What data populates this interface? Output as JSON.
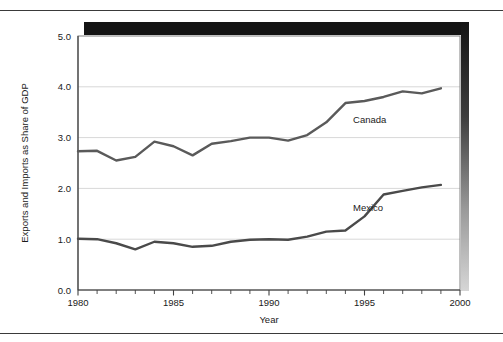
{
  "chart_data": {
    "type": "line",
    "title": "",
    "xlabel": "Year",
    "ylabel": "Exports and Imports as Share of GDP",
    "xlim": [
      1980,
      2000
    ],
    "ylim": [
      0.0,
      5.0
    ],
    "grid": true,
    "grid_axis": "y",
    "legend": "inline-annotations",
    "x_tick_labels": [
      "1980",
      "1985",
      "1990",
      "1995",
      "2000"
    ],
    "x_tick_values": [
      1980,
      1985,
      1990,
      1995,
      2000
    ],
    "x_minor_tick_interval": 1,
    "y_tick_labels": [
      "0.0",
      "1.0",
      "2.0",
      "3.0",
      "4.0",
      "5.0"
    ],
    "y_tick_values": [
      0.0,
      1.0,
      2.0,
      3.0,
      4.0,
      5.0
    ],
    "x": [
      1980,
      1981,
      1982,
      1983,
      1984,
      1985,
      1986,
      1987,
      1988,
      1989,
      1990,
      1991,
      1992,
      1993,
      1994,
      1995,
      1996,
      1997,
      1998,
      1999
    ],
    "series": [
      {
        "name": "Canada",
        "color": "#5a5a5a",
        "label_x": 1994.4,
        "label_y": 3.29,
        "values": [
          2.73,
          2.74,
          2.55,
          2.62,
          2.92,
          2.83,
          2.65,
          2.88,
          2.93,
          3.0,
          3.0,
          2.94,
          3.05,
          3.3,
          3.68,
          3.72,
          3.8,
          3.91,
          3.87,
          3.97
        ]
      },
      {
        "name": "Mexico",
        "color": "#4a4a4a",
        "label_x": 1994.4,
        "label_y": 1.56,
        "values": [
          1.01,
          1.0,
          0.92,
          0.8,
          0.95,
          0.92,
          0.85,
          0.87,
          0.95,
          0.99,
          1.0,
          0.99,
          1.05,
          1.15,
          1.17,
          1.45,
          1.88,
          1.95,
          2.02,
          2.07
        ]
      }
    ],
    "annotations": [
      "Canada",
      "Mexico"
    ]
  },
  "figure": {
    "top_rule": "",
    "bottom_rule": "",
    "shadow_color": "#1c1c1c",
    "plot_border_color": "#808080",
    "gridline_color": "#d8d8d8",
    "axis_color": "#404040",
    "background": "#ffffff"
  }
}
